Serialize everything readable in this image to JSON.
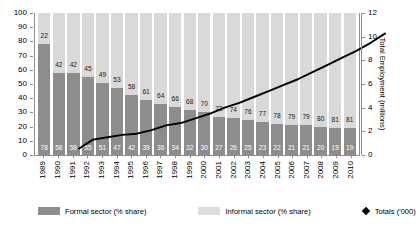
{
  "chart_data": {
    "type": "bar",
    "title": "",
    "subtitle": "",
    "xlabel": "",
    "ylabel": "",
    "ylabel_right": "Total Employment (millions)",
    "ylim": [
      0,
      100
    ],
    "ylim_right": [
      0,
      12
    ],
    "yticks": [
      100,
      90,
      80,
      70,
      60,
      50,
      40,
      30,
      20,
      10,
      0
    ],
    "yticks_right": [
      12,
      10,
      8,
      6,
      4,
      2,
      0
    ],
    "grid": false,
    "legend_position": "bottom",
    "categories": [
      "1989",
      "1990",
      "1991",
      "1992",
      "1993",
      "1994",
      "1995",
      "1996",
      "1997",
      "1998",
      "1999",
      "2000",
      "2001",
      "2002",
      "2003",
      "2004",
      "2005",
      "2006",
      "2007",
      "2008",
      "2009",
      "2010"
    ],
    "series": [
      {
        "name": "Formal sector (% share)",
        "type": "bar-stacked",
        "color": "#8d8d8d",
        "values": [
          78,
          58,
          58,
          55,
          51,
          47,
          42,
          39,
          36,
          34,
          32,
          30,
          27,
          26,
          25,
          23,
          22,
          21,
          21,
          20,
          19,
          19
        ]
      },
      {
        "name": "Informal sector (% share)",
        "type": "bar-stacked",
        "color": "#d9d9d9",
        "values": [
          22,
          42,
          42,
          45,
          49,
          53,
          58,
          61,
          64,
          66,
          68,
          70,
          73,
          74,
          76,
          77,
          78,
          79,
          79,
          80,
          81,
          81
        ]
      },
      {
        "name": "Totals ('000)",
        "type": "line",
        "color": "#000000",
        "axis": "right",
        "values": [
          1.6,
          2.4,
          2.6,
          2.8,
          2.9,
          3.2,
          3.6,
          3.8,
          4.2,
          4.6,
          5.1,
          5.5,
          6.0,
          6.5,
          7.0,
          7.5,
          8.1,
          8.7,
          9.3,
          9.9,
          10.6,
          11.4
        ]
      }
    ],
    "annotations": {
      "top_labels": [
        22,
        42,
        42,
        45,
        49,
        53,
        58,
        61,
        64,
        66,
        68,
        70,
        73,
        74,
        76,
        77,
        78,
        79,
        79,
        80,
        81,
        81
      ],
      "bottom_labels": [
        78,
        58,
        58,
        55,
        51,
        47,
        42,
        39,
        36,
        34,
        32,
        30,
        27,
        26,
        25,
        23,
        22,
        21,
        21,
        20,
        19,
        19
      ]
    }
  },
  "legend": {
    "items": [
      {
        "label": "Formal sector (% share)",
        "marker": "square-dark"
      },
      {
        "label": "Informal sector (% share)",
        "marker": "square-light"
      },
      {
        "label": "Totals ('000)",
        "marker": "diamond"
      }
    ]
  },
  "colors": {
    "formal": "#8d8d8d",
    "informal": "#d9d9d9",
    "line": "#000000",
    "axis": "#8c8c8c"
  }
}
